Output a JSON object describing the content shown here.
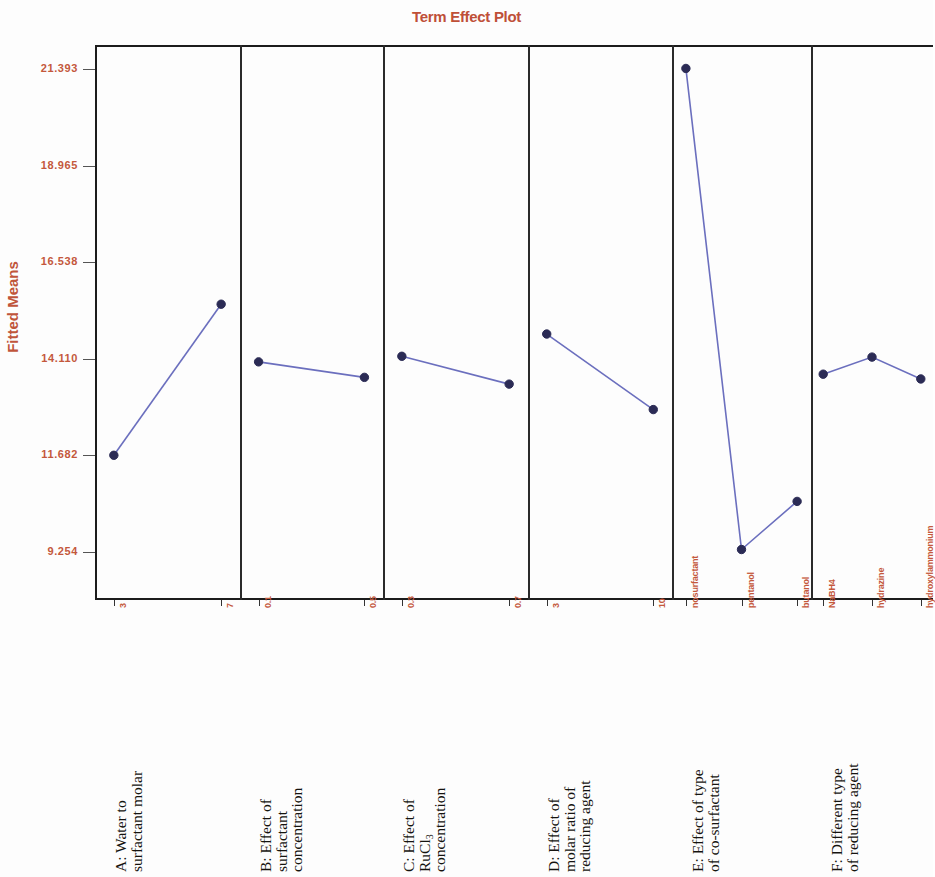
{
  "title": "Term Effect Plot",
  "y_axis_title": "Fitted Means",
  "colors": {
    "title": "#bf5038",
    "axis_text": "#c4583c",
    "series_line": "#6b6fbe",
    "marker": "#2b2b55",
    "frame": "#1c1c1c",
    "background": "#fdfdfd"
  },
  "yticks": [
    "21.393",
    "18.965",
    "16.538",
    "14.110",
    "11.682",
    "9.254"
  ],
  "panels": [
    {
      "id": "A",
      "desc_lines": [
        "A: Water to",
        "surfactant molar"
      ],
      "xlabels": [
        "3",
        "7"
      ]
    },
    {
      "id": "B",
      "desc_lines": [
        "B: Effect of",
        "surfactant",
        "concentration"
      ],
      "xlabels": [
        "0.1",
        "0.5"
      ]
    },
    {
      "id": "C",
      "desc_lines": [
        "C: Effect of",
        "RuCl3",
        "concentration"
      ],
      "xlabels": [
        "0.3",
        "0.7"
      ]
    },
    {
      "id": "D",
      "desc_lines": [
        "D: Effect of",
        "molar ratio of",
        "reducing agent"
      ],
      "xlabels": [
        "3",
        "10"
      ]
    },
    {
      "id": "E",
      "desc_lines": [
        "E: Effect of type",
        "of co-surfactant"
      ],
      "xlabels": [
        "nosurfactant",
        "pentanol",
        "butanol"
      ]
    },
    {
      "id": "F",
      "desc_lines": [
        "F: Different type",
        "of reducing agent"
      ],
      "xlabels": [
        "NaBH4",
        "hydrazine",
        "hydroxylammonium"
      ]
    }
  ],
  "chart_data": {
    "type": "line",
    "title": "Term Effect Plot",
    "xlabel": "",
    "ylabel": "Fitted Means",
    "ylim": [
      8.04,
      22.0
    ],
    "ytick_values": [
      21.393,
      18.965,
      16.538,
      14.11,
      11.682,
      9.254
    ],
    "grid": false,
    "legend": "none",
    "panel_layout": "6 vertical panels sharing one y-axis",
    "series": [
      {
        "name": "A: Water to surfactant molar",
        "categories": [
          "3",
          "7"
        ],
        "values": [
          11.68,
          15.48
        ]
      },
      {
        "name": "B: Effect of surfactant concentration",
        "categories": [
          "0.1",
          "0.5"
        ],
        "values": [
          14.03,
          13.64
        ]
      },
      {
        "name": "C: Effect of RuCl3 concentration",
        "categories": [
          "0.3",
          "0.7"
        ],
        "values": [
          14.17,
          13.47
        ]
      },
      {
        "name": "D: Effect of molar ratio of reducing agent",
        "categories": [
          "3",
          "10"
        ],
        "values": [
          14.73,
          12.83
        ]
      },
      {
        "name": "E: Effect of type of co-surfactant",
        "categories": [
          "nosurfactant",
          "pentanol",
          "butanol"
        ],
        "values": [
          21.41,
          9.31,
          10.52
        ]
      },
      {
        "name": "F: Different type of reducing agent",
        "categories": [
          "NaBH4",
          "hydrazine",
          "hydroxylammonium"
        ],
        "values": [
          13.72,
          14.15,
          13.6
        ]
      }
    ]
  }
}
